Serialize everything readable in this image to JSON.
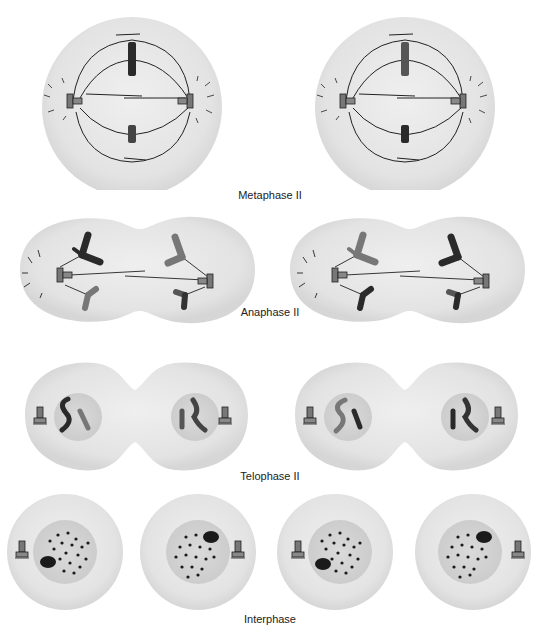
{
  "diagram": {
    "colors": {
      "cytoplasm": "#e6e6e6",
      "cytoplasm_edge": "#d4d4d4",
      "nucleus": "#d0d0d0",
      "chromosome_dark": "#2a2a2a",
      "chromosome_gray": "#7a7a7a",
      "spindle": "#222222"
    },
    "stages": [
      {
        "id": "metaphase-ii",
        "label": "Metaphase II",
        "cells": 2
      },
      {
        "id": "anaphase-ii",
        "label": "Anaphase II",
        "cells": 2
      },
      {
        "id": "telophase-ii",
        "label": "Telophase II",
        "cells": 2
      },
      {
        "id": "interphase",
        "label": "Interphase",
        "cells": 4
      }
    ]
  }
}
